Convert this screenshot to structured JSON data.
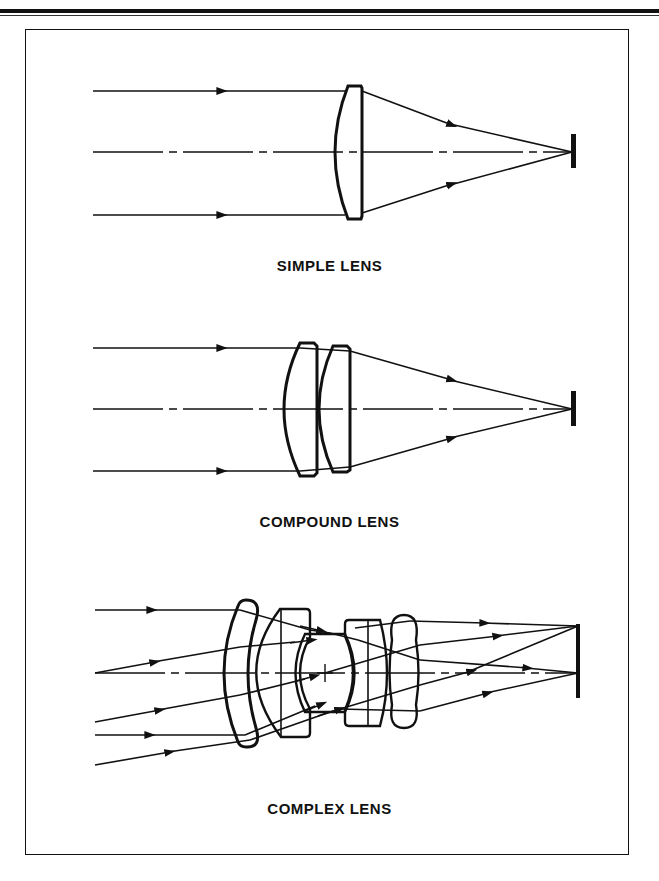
{
  "figure": {
    "panels": [
      {
        "id": "simple",
        "caption": "SIMPLE LENS"
      },
      {
        "id": "compound",
        "caption": "COMPOUND LENS"
      },
      {
        "id": "complex",
        "caption": "COMPLEX LENS"
      }
    ]
  },
  "colors": {
    "ink": "#111111",
    "background": "#ffffff"
  }
}
